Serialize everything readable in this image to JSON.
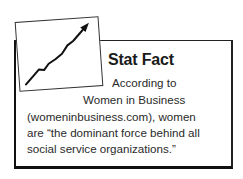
{
  "sidebar_box": {
    "title": "Stat Fact",
    "icon": "rising-line-chart-icon",
    "lines": [
      "According to",
      "Women in Business",
      "(womeninbusiness.com), women",
      "are “the dominant force behind all",
      "social service organizations.”"
    ]
  }
}
